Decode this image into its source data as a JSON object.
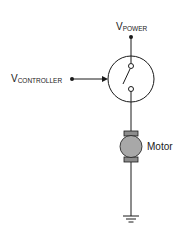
{
  "diagram": {
    "type": "circuit-schematic",
    "colors": {
      "line": "#1a1a1a",
      "motor_fill": "#a8a8a8",
      "bracket_fill": "#8c8c8c",
      "background": "#ffffff"
    },
    "labels": {
      "power": {
        "main": "V",
        "sub": "POWER"
      },
      "controller": {
        "main": "V",
        "sub": "CONTROLLER"
      },
      "motor": "Motor"
    },
    "components": [
      {
        "id": "power-terminal",
        "kind": "terminal"
      },
      {
        "id": "controller-terminal",
        "kind": "terminal"
      },
      {
        "id": "switch",
        "kind": "controlled-switch",
        "state": "open"
      },
      {
        "id": "motor",
        "kind": "dc-motor"
      },
      {
        "id": "ground",
        "kind": "ground"
      }
    ]
  }
}
